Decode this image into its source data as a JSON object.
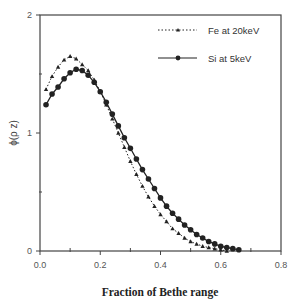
{
  "chart_data": {
    "type": "line",
    "title": "",
    "xlabel": "Fraction of Bethe range",
    "ylabel": "ϕ(ρ z)",
    "xlim": [
      0,
      0.8
    ],
    "ylim": [
      0,
      2
    ],
    "x_ticks": [
      0.0,
      0.2,
      0.4,
      0.6,
      0.8
    ],
    "x_tick_labels": [
      "0.0",
      "0.2",
      "0.4",
      "0.6",
      "0.8"
    ],
    "x_minor_ticks": [
      0.1,
      0.3,
      0.5,
      0.7
    ],
    "y_ticks": [
      0,
      1,
      2
    ],
    "y_tick_labels": [
      "0",
      "1",
      "2"
    ],
    "y_minor_ticks": [
      0.5,
      1.5
    ],
    "grid": false,
    "legend_position": "upper right",
    "series": [
      {
        "name": "Fe at 20keV",
        "line_style": "dotted",
        "marker": "triangle",
        "x": [
          0.02,
          0.04,
          0.06,
          0.08,
          0.1,
          0.12,
          0.14,
          0.16,
          0.18,
          0.2,
          0.22,
          0.24,
          0.26,
          0.28,
          0.3,
          0.32,
          0.34,
          0.36,
          0.38,
          0.4,
          0.42,
          0.44,
          0.46,
          0.48,
          0.5,
          0.52,
          0.54,
          0.56,
          0.58,
          0.6,
          0.62
        ],
        "y": [
          1.37,
          1.48,
          1.56,
          1.62,
          1.65,
          1.63,
          1.58,
          1.53,
          1.45,
          1.35,
          1.24,
          1.12,
          1.0,
          0.88,
          0.76,
          0.65,
          0.55,
          0.46,
          0.38,
          0.31,
          0.25,
          0.19,
          0.15,
          0.11,
          0.08,
          0.06,
          0.04,
          0.03,
          0.02,
          0.01,
          0.0
        ]
      },
      {
        "name": "Si at 5keV",
        "line_style": "solid",
        "marker": "circle",
        "x": [
          0.02,
          0.04,
          0.06,
          0.08,
          0.1,
          0.12,
          0.14,
          0.16,
          0.18,
          0.2,
          0.22,
          0.24,
          0.26,
          0.28,
          0.3,
          0.32,
          0.34,
          0.36,
          0.38,
          0.4,
          0.42,
          0.44,
          0.46,
          0.48,
          0.5,
          0.52,
          0.54,
          0.56,
          0.58,
          0.6,
          0.62,
          0.64,
          0.66
        ],
        "y": [
          1.24,
          1.33,
          1.39,
          1.46,
          1.51,
          1.54,
          1.53,
          1.49,
          1.43,
          1.35,
          1.26,
          1.16,
          1.06,
          0.96,
          0.87,
          0.78,
          0.69,
          0.61,
          0.53,
          0.45,
          0.38,
          0.32,
          0.27,
          0.22,
          0.18,
          0.14,
          0.11,
          0.08,
          0.06,
          0.04,
          0.03,
          0.02,
          0.01
        ]
      }
    ]
  },
  "colors": {
    "axis": "#444444",
    "series_line": "#222222",
    "background": "#ffffff"
  }
}
